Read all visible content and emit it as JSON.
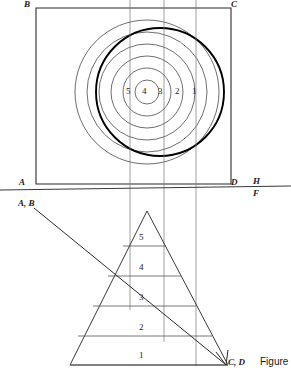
{
  "figure": {
    "caption": "Figure"
  },
  "colors": {
    "line": "#2b2b2b",
    "thin_line": "#555555",
    "heavy_line": "#000000",
    "background": "#ffffff",
    "text": "#1a1a1a"
  },
  "reference_line": {
    "upper_label": "H",
    "lower_label": "F",
    "upper_label_x": 253,
    "upper_label_y": 180,
    "lower_label_x": 253,
    "lower_label_y": 192,
    "y": 188
  },
  "plan_view": {
    "corners": [
      {
        "label": "B",
        "x": 24,
        "y": 1,
        "corner_x": 36,
        "corner_y": 8
      },
      {
        "label": "C",
        "x": 232,
        "y": 1,
        "corner_x": 231,
        "corner_y": 8
      },
      {
        "label": "A",
        "x": 20,
        "y": 180,
        "corner_x": 36,
        "corner_y": 184
      },
      {
        "label": "D",
        "x": 232,
        "y": 180,
        "corner_x": 231,
        "corner_y": 184
      }
    ],
    "center_x": 147,
    "center_y": 92,
    "contour_radii": [
      12,
      24,
      36,
      48,
      60,
      72
    ],
    "contour_labels": [
      {
        "label": "5",
        "x": 129,
        "y": 88
      },
      {
        "label": "4",
        "x": 144,
        "y": 88
      },
      {
        "label": "3",
        "x": 160,
        "y": 88
      },
      {
        "label": "2",
        "x": 177,
        "y": 88
      },
      {
        "label": "1",
        "x": 193,
        "y": 88
      }
    ],
    "cutting_circle": {
      "cx": 160,
      "cy": 92,
      "r": 64
    },
    "projector_lines_x": [
      130,
      164,
      196
    ]
  },
  "elevation_view": {
    "apex_x": 147,
    "apex_y": 211,
    "base_left_x": 70,
    "base_right_x": 228,
    "base_y": 365,
    "contour_lines": [
      {
        "label": "5",
        "y": 246,
        "left_x": 123,
        "right_x": 166,
        "label_x": 142,
        "label_y": 236
      },
      {
        "label": "4",
        "y": 276,
        "left_x": 108,
        "right_x": 181,
        "label_x": 142,
        "label_y": 266
      },
      {
        "label": "3",
        "y": 306,
        "left_x": 93,
        "right_x": 196,
        "label_x": 142,
        "label_y": 296
      },
      {
        "label": "2",
        "y": 336,
        "left_x": 78,
        "right_x": 212,
        "label_x": 142,
        "label_y": 326
      },
      {
        "label": "1",
        "y": 365,
        "left_x": 70,
        "right_x": 228,
        "label_x": 142,
        "label_y": 353
      }
    ],
    "cut_line": {
      "start_label": "A, B",
      "start_label_x": 18,
      "start_label_y": 200,
      "start_x": 34,
      "start_y": 208,
      "end_label": "C, D",
      "end_label_x": 227,
      "end_label_y": 360,
      "end_x": 225,
      "end_y": 364
    }
  }
}
